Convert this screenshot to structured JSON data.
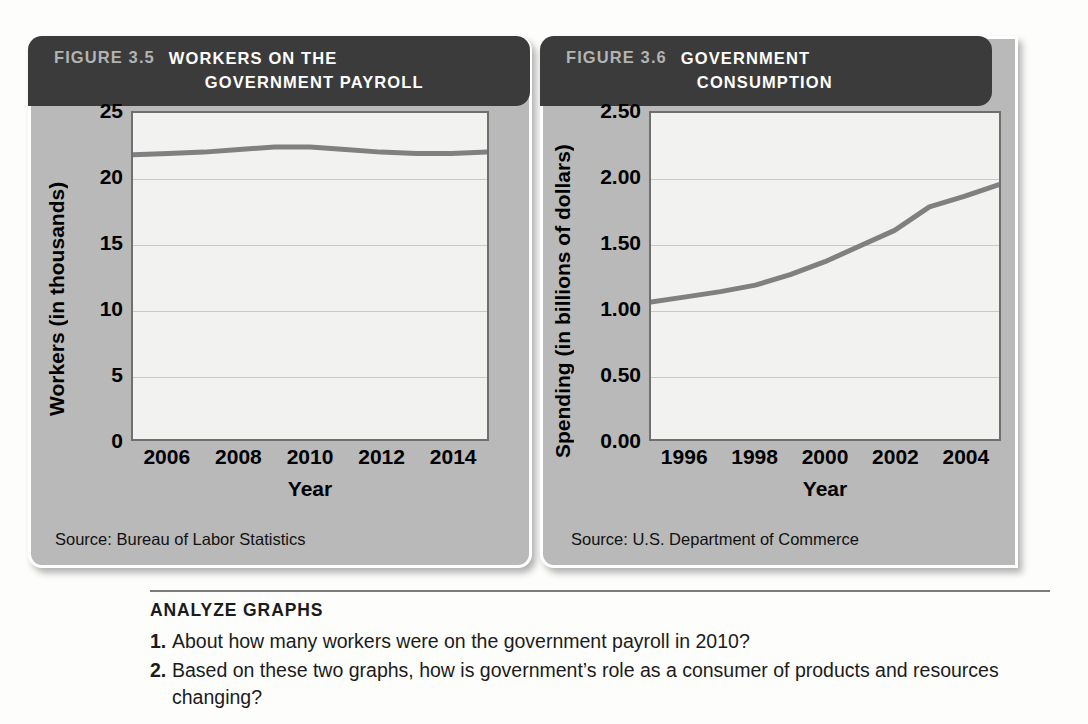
{
  "figures": [
    {
      "id": "figure-3-5",
      "number": "FIGURE 3.5",
      "title_line1": "WORKERS ON THE",
      "title_line2": "GOVERNMENT PAYROLL",
      "source": "Source: Bureau of Labor Statistics",
      "ylabel": "Workers (in thousands)",
      "xlabel": "Year",
      "yticks": [
        "25",
        "20",
        "15",
        "10",
        "5",
        "0"
      ],
      "xticks": [
        "2006",
        "2008",
        "2010",
        "2012",
        "2014"
      ]
    },
    {
      "id": "figure-3-6",
      "number": "FIGURE 3.6",
      "title_line1": "GOVERNMENT",
      "title_line2": "CONSUMPTION",
      "source": "Source: U.S. Department of Commerce",
      "ylabel": "Spending (in billions of dollars)",
      "xlabel": "Year",
      "yticks": [
        "2.50",
        "2.00",
        "1.50",
        "1.00",
        "0.50",
        "0.00"
      ],
      "xticks": [
        "1996",
        "1998",
        "2000",
        "2002",
        "2004"
      ]
    }
  ],
  "analyze": {
    "heading": "ANALYZE GRAPHS",
    "questions": [
      {
        "num": "1.",
        "text": "About how many workers were on the government payroll in 2010?"
      },
      {
        "num": "2.",
        "text": "Based on these two graphs, how is government’s role as a consumer of products and resources changing?"
      }
    ]
  },
  "colors": {
    "header_bar": "#3b3b3b",
    "panel_body": "#b9b9b9",
    "plot_bg": "#f2f2f0",
    "plot_border": "#6f6f6f",
    "gridline": "#c9c9c9",
    "series_line": "#808080",
    "figure_number_text": "#b3b3b3",
    "title_text": "#ffffff"
  },
  "chart_data": [
    {
      "type": "line",
      "title": "FIGURE 3.5 WORKERS ON THE GOVERNMENT PAYROLL",
      "xlabel": "Year",
      "ylabel": "Workers (in thousands)",
      "source": "Source: Bureau of Labor Statistics",
      "xlim": [
        2005,
        2015
      ],
      "ylim": [
        0,
        25
      ],
      "yticks": [
        0,
        5,
        10,
        15,
        20,
        25
      ],
      "xticks": [
        2006,
        2008,
        2010,
        2012,
        2014
      ],
      "grid": "horizontal",
      "legend": "none",
      "series": [
        {
          "name": "Workers on the government payroll",
          "x": [
            2005,
            2006,
            2007,
            2008,
            2009,
            2010,
            2011,
            2012,
            2013,
            2014,
            2015
          ],
          "values": [
            21.8,
            21.9,
            22.0,
            22.2,
            22.4,
            22.4,
            22.2,
            22.0,
            21.9,
            21.9,
            22.0
          ]
        }
      ]
    },
    {
      "type": "line",
      "title": "FIGURE 3.6 GOVERNMENT CONSUMPTION",
      "xlabel": "Year",
      "ylabel": "Spending (in billions of dollars)",
      "source": "Source: U.S. Department of Commerce",
      "xlim": [
        1995,
        2005
      ],
      "ylim": [
        0.0,
        2.5
      ],
      "yticks": [
        0.0,
        0.5,
        1.0,
        1.5,
        2.0,
        2.5
      ],
      "xticks": [
        1996,
        1998,
        2000,
        2002,
        2004
      ],
      "grid": "horizontal",
      "legend": "none",
      "series": [
        {
          "name": "Government consumption spending",
          "x": [
            1995,
            1996,
            1997,
            1998,
            1999,
            2000,
            2001,
            2002,
            2003,
            2004,
            2005
          ],
          "values": [
            1.05,
            1.09,
            1.13,
            1.18,
            1.26,
            1.36,
            1.48,
            1.6,
            1.78,
            1.86,
            1.95
          ]
        }
      ]
    }
  ]
}
